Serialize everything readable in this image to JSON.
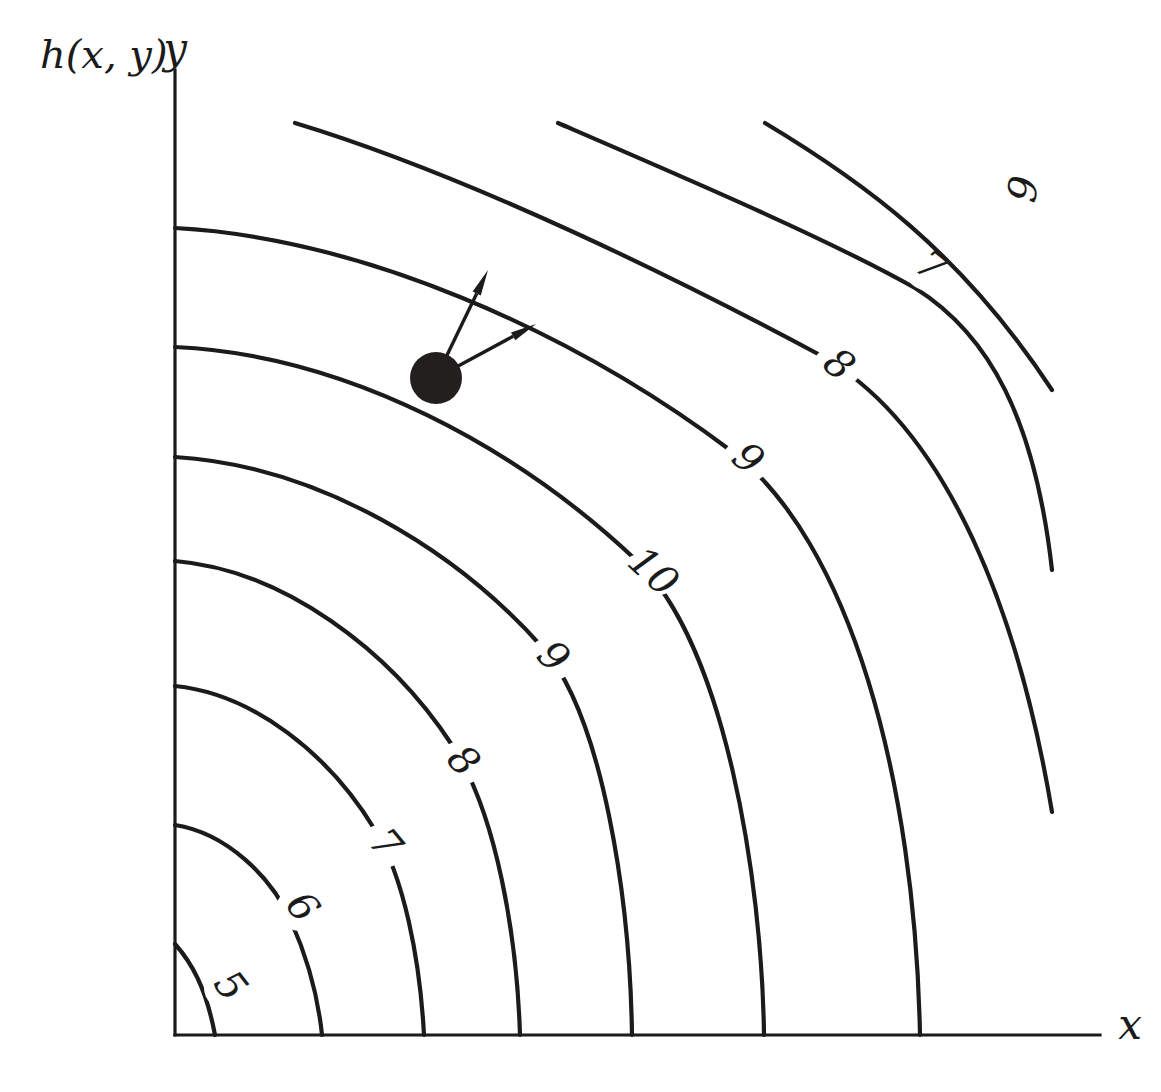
{
  "figure": {
    "kind": "contour-plot",
    "function_label": "h(x, y)",
    "axes": {
      "x_label": "x",
      "y_label": "y",
      "origin_px": [
        175,
        1035
      ],
      "x_axis_end_px": [
        1100,
        1035
      ],
      "y_axis_top_px": [
        175,
        70
      ]
    },
    "marked_point": {
      "name": "evaluation-point",
      "center_px": [
        436,
        378
      ],
      "radius_px": 26
    },
    "vectors": [
      {
        "name": "gradient-vector",
        "from_px": [
          436,
          378
        ],
        "to_px": [
          488,
          270
        ]
      },
      {
        "name": "direction-vector",
        "from_px": [
          436,
          378
        ],
        "to_px": [
          536,
          324
        ]
      }
    ],
    "colors": {
      "ink": "#1b1b1b",
      "dot": "#231f1e",
      "background": "#ffffff"
    }
  },
  "chart_data": {
    "type": "contour",
    "title": "",
    "xlabel": "x",
    "ylabel": "y",
    "function": "h(x, y)",
    "grid": false,
    "legend": false,
    "level_labels": [
      "5",
      "6",
      "7",
      "8",
      "9",
      "10",
      "9",
      "8",
      "7",
      "6"
    ],
    "levels": [
      5,
      6,
      7,
      8,
      9,
      10,
      9,
      8,
      7,
      6
    ],
    "contours": [
      {
        "level": 5,
        "label": "5",
        "label_px": [
          228,
          988
        ],
        "label_rotation_deg": 52,
        "path": "M 175,944 C 191,962 206,987 215,1035"
      },
      {
        "level": 6,
        "label": "6",
        "label_px": [
          300,
          909
        ],
        "label_rotation_deg": 52,
        "path": "M 175,825 C 226,833 271,876 291,921 C 307,957 318,996 322,1035"
      },
      {
        "level": 7,
        "label": "7",
        "label_px": [
          383,
          846
        ],
        "label_rotation_deg": 50,
        "path": "M 175,686 C 254,694 330,755 375,830 C 404,877 420,960 424,1035"
      },
      {
        "level": 8,
        "label": "8",
        "label_px": [
          461,
          763
        ],
        "label_rotation_deg": 48,
        "path": "M 175,561 C 283,570 390,650 452,745 C 497,814 517,938 520,1035"
      },
      {
        "level": 9,
        "label": "9",
        "label_px": [
          551,
          659
        ],
        "label_rotation_deg": 45,
        "path": "M 175,457 C 320,466 457,551 542,647 C 603,716 630,900 632,1035"
      },
      {
        "level": 10,
        "label": "10",
        "label_px": [
          651,
          574
        ],
        "label_rotation_deg": 43,
        "path": "M 175,347 C 350,355 520,450 637,561 C 725,645 762,880 764,1035"
      },
      {
        "level": 9,
        "label": "9",
        "label_px": [
          746,
          461
        ],
        "label_rotation_deg": 41,
        "path": "M 175,228 C 360,238 570,330 730,450 C 850,540 915,780 920,1035"
      },
      {
        "level": 8,
        "label": "8",
        "label_px": [
          837,
          367
        ],
        "label_rotation_deg": 40,
        "path": "M 295,123 C 470,176 680,280 820,355 C 950,428 1020,620 1052,812"
      },
      {
        "level": 7,
        "label": "7",
        "label_px": [
          929,
          269
        ],
        "label_rotation_deg": 38,
        "path": "M 558,123 C 690,180 830,240 915,288 C 990,335 1035,420 1052,570"
      },
      {
        "level": 6,
        "label": "6",
        "label_px": [
          1018,
          188
        ],
        "label_rotation_deg": 100,
        "path": "M 765,123 C 860,180 960,250 1052,390"
      }
    ]
  }
}
